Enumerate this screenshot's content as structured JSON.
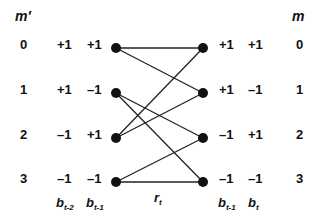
{
  "diagram": {
    "type": "trellis",
    "left_header": "m′",
    "right_header": "m",
    "left_states": [
      {
        "index": "0",
        "b1": "+1",
        "b2": "+1"
      },
      {
        "index": "1",
        "b1": "+1",
        "b2": "–1"
      },
      {
        "index": "2",
        "b1": "–1",
        "b2": "+1"
      },
      {
        "index": "3",
        "b1": "–1",
        "b2": "–1"
      }
    ],
    "right_states": [
      {
        "index": "0",
        "b1": "+1",
        "b2": "+1"
      },
      {
        "index": "1",
        "b1": "+1",
        "b2": "–1"
      },
      {
        "index": "2",
        "b1": "–1",
        "b2": "+1"
      },
      {
        "index": "3",
        "b1": "–1",
        "b2": "–1"
      }
    ],
    "left_col_labels": {
      "b1": {
        "base": "b",
        "sub": "t-2"
      },
      "b2": {
        "base": "b",
        "sub": "t-1"
      }
    },
    "right_col_labels": {
      "b1": {
        "base": "b",
        "sub": "t-1"
      },
      "b2": {
        "base": "b",
        "sub": "t"
      }
    },
    "branch_label": {
      "base": "r",
      "sub": "t"
    },
    "edges": [
      [
        0,
        0
      ],
      [
        0,
        1
      ],
      [
        1,
        2
      ],
      [
        1,
        3
      ],
      [
        2,
        0
      ],
      [
        2,
        1
      ],
      [
        3,
        2
      ],
      [
        3,
        3
      ]
    ]
  }
}
